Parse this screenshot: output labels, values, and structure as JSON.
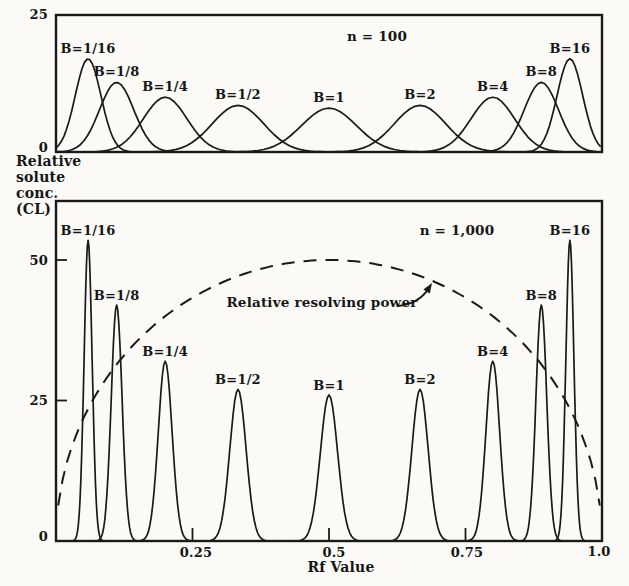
{
  "colors": {
    "ink": "#1a1a1a",
    "paper": "#fbfaf7"
  },
  "ylabel": {
    "lines": [
      "Relative",
      "solute",
      "conc.",
      "(CL)"
    ]
  },
  "chart_data": [
    {
      "type": "line",
      "title": "n = 100",
      "xlabel": "",
      "ylabel": "Relative solute conc. (CL)",
      "xlim": [
        0,
        1.0
      ],
      "ylim": [
        0,
        25
      ],
      "yticks": [
        0,
        25
      ],
      "ytick_labels": [
        "0",
        "25"
      ],
      "grid": false,
      "legend": "none",
      "series": [
        {
          "name": "B=1/16",
          "B": 0.0625,
          "peak_rf": 0.0588,
          "peak_height": 17.0,
          "sigma": 0.0235
        },
        {
          "name": "B=1/8",
          "B": 0.125,
          "peak_rf": 0.1111,
          "peak_height": 12.7,
          "sigma": 0.0314
        },
        {
          "name": "B=1/4",
          "B": 0.25,
          "peak_rf": 0.2,
          "peak_height": 10.0,
          "sigma": 0.04
        },
        {
          "name": "B=1/2",
          "B": 0.5,
          "peak_rf": 0.3333,
          "peak_height": 8.5,
          "sigma": 0.0471
        },
        {
          "name": "B=1",
          "B": 1,
          "peak_rf": 0.5,
          "peak_height": 8.0,
          "sigma": 0.05
        },
        {
          "name": "B=2",
          "B": 2,
          "peak_rf": 0.6667,
          "peak_height": 8.5,
          "sigma": 0.0471
        },
        {
          "name": "B=4",
          "B": 4,
          "peak_rf": 0.8,
          "peak_height": 10.0,
          "sigma": 0.04
        },
        {
          "name": "B=8",
          "B": 8,
          "peak_rf": 0.8889,
          "peak_height": 12.7,
          "sigma": 0.0314
        },
        {
          "name": "B=16",
          "B": 16,
          "peak_rf": 0.9412,
          "peak_height": 17.0,
          "sigma": 0.0235
        }
      ]
    },
    {
      "type": "line",
      "title": "n = 1,000",
      "xlabel": "Rf Value",
      "ylabel": "Relative solute conc. (CL)",
      "xlim": [
        0,
        1.0
      ],
      "ylim": [
        0,
        60
      ],
      "xticks": [
        0.25,
        0.5,
        0.75,
        1.0
      ],
      "xtick_labels": [
        "0.25",
        "0.5",
        "0.75",
        "1.0"
      ],
      "yticks": [
        0,
        25,
        50
      ],
      "ytick_labels": [
        "0",
        "25",
        "50"
      ],
      "grid": false,
      "legend": "none",
      "series": [
        {
          "name": "B=1/16",
          "B": 0.0625,
          "peak_rf": 0.0588,
          "peak_height": 53.5,
          "sigma": 0.0074
        },
        {
          "name": "B=1/8",
          "B": 0.125,
          "peak_rf": 0.1111,
          "peak_height": 42.0,
          "sigma": 0.0099
        },
        {
          "name": "B=1/4",
          "B": 0.25,
          "peak_rf": 0.2,
          "peak_height": 32.0,
          "sigma": 0.0127
        },
        {
          "name": "B=1/2",
          "B": 0.5,
          "peak_rf": 0.3333,
          "peak_height": 27.0,
          "sigma": 0.0149
        },
        {
          "name": "B=1",
          "B": 1,
          "peak_rf": 0.5,
          "peak_height": 26.0,
          "sigma": 0.0158
        },
        {
          "name": "B=2",
          "B": 2,
          "peak_rf": 0.6667,
          "peak_height": 27.0,
          "sigma": 0.0149
        },
        {
          "name": "B=4",
          "B": 4,
          "peak_rf": 0.8,
          "peak_height": 32.0,
          "sigma": 0.0127
        },
        {
          "name": "B=8",
          "B": 8,
          "peak_rf": 0.8889,
          "peak_height": 42.0,
          "sigma": 0.0099
        },
        {
          "name": "B=16",
          "B": 16,
          "peak_rf": 0.9412,
          "peak_height": 53.5,
          "sigma": 0.0074
        }
      ],
      "resolving_power": {
        "label": "Relative resolving power",
        "style": "dashed",
        "formula": "value = 100 * sqrt(Rf*(1-Rf))",
        "peak": {
          "rf": 0.5,
          "value": 50
        },
        "endpoints": [
          {
            "rf": 0,
            "value": 0
          },
          {
            "rf": 1.0,
            "value": 0
          }
        ]
      }
    }
  ]
}
